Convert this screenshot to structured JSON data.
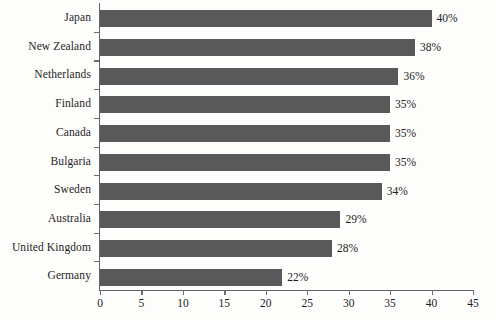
{
  "chart_data": {
    "type": "bar",
    "orientation": "horizontal",
    "title": "",
    "subtitle": "",
    "xlabel": "",
    "ylabel": "",
    "xlim": [
      0,
      45
    ],
    "xticks": [
      0,
      5,
      10,
      15,
      20,
      25,
      30,
      35,
      40,
      45
    ],
    "xtick_labels": [
      "0",
      "5",
      "10",
      "15",
      "20",
      "25",
      "30",
      "35",
      "40",
      "45"
    ],
    "grid": false,
    "legend": null,
    "bar_color": "#595959",
    "axis_color": "#636363",
    "text_color": "#1d1d1d",
    "background_color": "#fdfdfc",
    "value_suffix": "%",
    "categories": [
      "Japan",
      "New Zealand",
      "Netherlands",
      "Finland",
      "Canada",
      "Bulgaria",
      "Sweden",
      "Australia",
      "United Kingdom",
      "Germany"
    ],
    "values": [
      40,
      38,
      36,
      35,
      35,
      35,
      34,
      29,
      28,
      22
    ],
    "data_labels": [
      "40%",
      "38%",
      "36%",
      "35%",
      "35%",
      "35%",
      "34%",
      "29%",
      "28%",
      "22%"
    ]
  }
}
